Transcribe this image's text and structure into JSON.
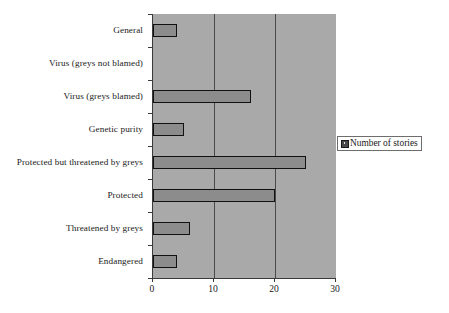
{
  "chart_data": {
    "type": "bar",
    "orientation": "horizontal",
    "title": "",
    "xlabel": "",
    "ylabel": "",
    "xlim": [
      0,
      30
    ],
    "xticks": [
      0,
      10,
      20,
      30
    ],
    "xtick_labels": [
      "0",
      "10",
      "20",
      "30"
    ],
    "grid": true,
    "gridlines_at": [
      10,
      20
    ],
    "legend_position": "right",
    "categories": [
      "General",
      "Virus (greys not blamed)",
      "Virus (greys blamed)",
      "Genetic purity",
      "Protected but threatened by greys",
      "Protected",
      "Threatened by greys",
      "Endangered"
    ],
    "series": [
      {
        "name": "Number of stories",
        "values": [
          4,
          0,
          16,
          5,
          25,
          20,
          6,
          4
        ],
        "color": "#8c8c8c",
        "edge_color": "#111111"
      }
    ]
  },
  "legend": {
    "label": "Number of stories",
    "marker": "filled-square-marker"
  },
  "axis": {
    "x_tick_labels": [
      "0",
      "10",
      "20",
      "30"
    ]
  },
  "colors": {
    "plot_background": "#a9a9a9",
    "bar_fill": "#8c8c8c",
    "bar_edge": "#111111",
    "gridline": "#4a4a4a",
    "axis_line": "#3a3a3a",
    "page_background": "#ffffff",
    "text": "#1a1a1a"
  }
}
